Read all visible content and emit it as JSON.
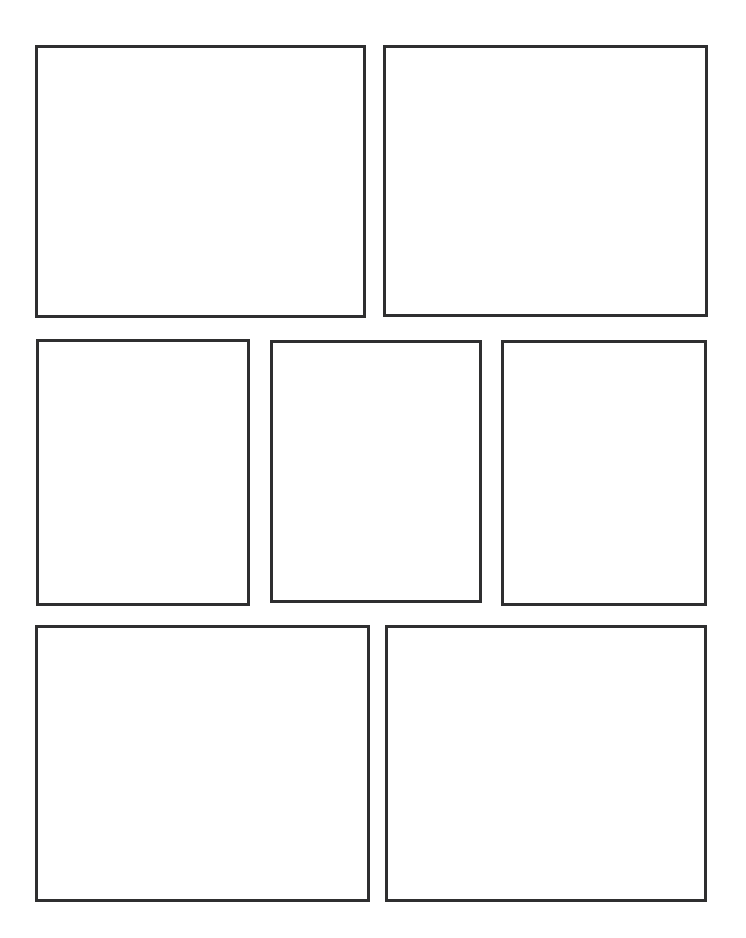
{
  "page": {
    "width": 746,
    "height": 938,
    "background_color": "#ffffff",
    "border_color": "#2f2f30",
    "border_width_px": 3,
    "panel_count": 7,
    "row_count": 3
  },
  "panels": [
    {
      "id": "panel-1",
      "label": "",
      "row": 1,
      "column": 1,
      "x": 35,
      "y": 45,
      "width": 331,
      "height": 273,
      "border_width_px": 3,
      "border_color": "#2f2f30",
      "fill_color": "#ffffff"
    },
    {
      "id": "panel-2",
      "label": "",
      "row": 1,
      "column": 2,
      "x": 383,
      "y": 45,
      "width": 325,
      "height": 272,
      "border_width_px": 3,
      "border_color": "#2f2f30",
      "fill_color": "#ffffff"
    },
    {
      "id": "panel-3",
      "label": "",
      "row": 2,
      "column": 1,
      "x": 36,
      "y": 339,
      "width": 214,
      "height": 267,
      "border_width_px": 3,
      "border_color": "#2f2f30",
      "fill_color": "#ffffff"
    },
    {
      "id": "panel-4",
      "label": "",
      "row": 2,
      "column": 2,
      "x": 270,
      "y": 340,
      "width": 212,
      "height": 263,
      "border_width_px": 3,
      "border_color": "#2f2f30",
      "fill_color": "#ffffff"
    },
    {
      "id": "panel-5",
      "label": "",
      "row": 2,
      "column": 3,
      "x": 501,
      "y": 340,
      "width": 206,
      "height": 266,
      "border_width_px": 3,
      "border_color": "#2f2f30",
      "fill_color": "#ffffff"
    },
    {
      "id": "panel-6",
      "label": "",
      "row": 3,
      "column": 1,
      "x": 35,
      "y": 625,
      "width": 335,
      "height": 277,
      "border_width_px": 3,
      "border_color": "#2f2f30",
      "fill_color": "#ffffff"
    },
    {
      "id": "panel-7",
      "label": "",
      "row": 3,
      "column": 2,
      "x": 385,
      "y": 625,
      "width": 322,
      "height": 277,
      "border_width_px": 3,
      "border_color": "#2f2f30",
      "fill_color": "#ffffff"
    }
  ]
}
